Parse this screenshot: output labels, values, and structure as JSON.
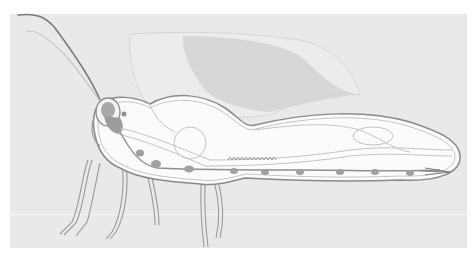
{
  "illustration": {
    "subject": "insect-internal-anatomy-side-view",
    "colors": {
      "background": "#e9e9e9",
      "panel_outer": "#ffffff",
      "body_fill": "#fafafa",
      "outline": "#8a8a8a",
      "inner_line": "#c4c4c4",
      "nerve_cord": "#8f8f8f",
      "ganglia": "#a0a0a0",
      "wing": "#d4d4d4",
      "head_organ": "#9c9c9c"
    }
  }
}
